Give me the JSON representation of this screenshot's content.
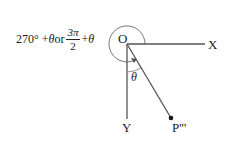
{
  "diagram": {
    "angle_label": {
      "part1": "270° + ",
      "theta1": "θ",
      "or": " or ",
      "frac_num": "3π",
      "frac_den": "2",
      "plus": " + ",
      "theta2": "θ"
    },
    "origin_label": "O",
    "x_label": "X",
    "y_label": "Y",
    "point_label": "P'''",
    "inner_angle_label": "θ",
    "colors": {
      "line": "#555555",
      "text": "#222222",
      "point": "#111111"
    }
  }
}
